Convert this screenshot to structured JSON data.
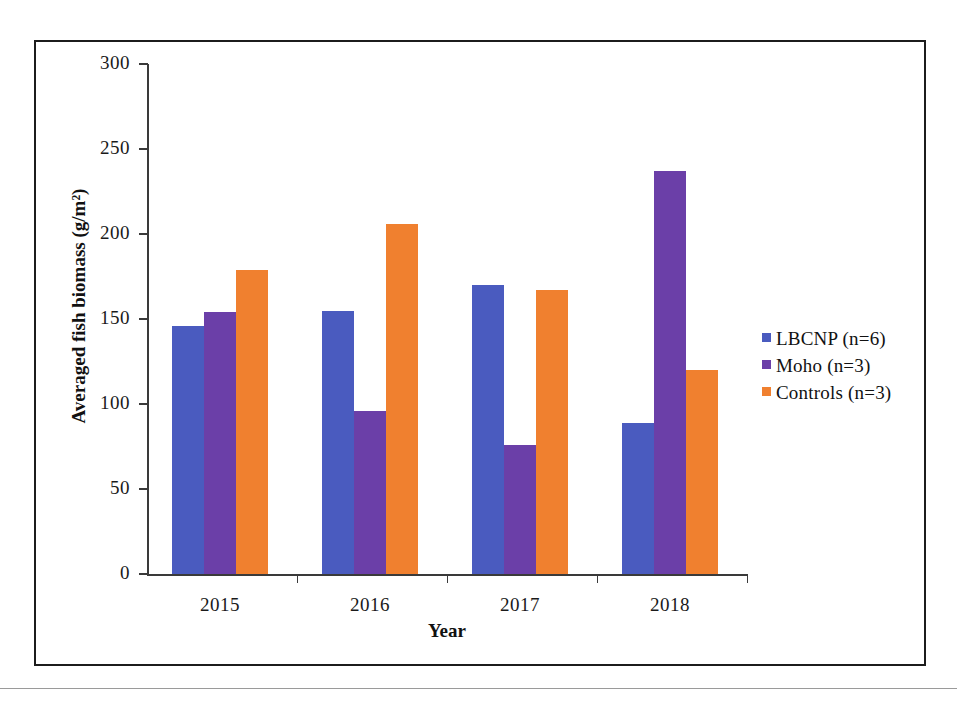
{
  "chart_data": {
    "type": "bar",
    "title": "",
    "xlabel": "Year",
    "ylabel": "Averaged fish biomass (g/m²)",
    "categories": [
      "2015",
      "2016",
      "2017",
      "2018"
    ],
    "series": [
      {
        "name": "LBCNP (n=6)",
        "color": "#4a5bbf",
        "values": [
          146,
          155,
          170,
          89
        ]
      },
      {
        "name": "Moho (n=3)",
        "color": "#6b3fa8",
        "values": [
          154,
          96,
          76,
          237
        ]
      },
      {
        "name": "Controls (n=3)",
        "color": "#f0802f",
        "values": [
          179,
          206,
          167,
          120
        ]
      }
    ],
    "ylim": [
      0,
      300
    ],
    "yticks": [
      "0",
      "50",
      "100",
      "150",
      "200",
      "250",
      "300"
    ],
    "ytick_values": [
      0,
      50,
      100,
      150,
      200,
      250,
      300
    ],
    "grid": false,
    "legend_position": "right",
    "bar_style": "grouped"
  },
  "axes": {
    "y_title": "Averaged fish biomass (g/m²)",
    "x_title": "Year"
  },
  "legend": {
    "items": [
      {
        "label": "LBCNP (n=6)",
        "color": "#4a5bbf"
      },
      {
        "label": "Moho (n=3)",
        "color": "#6b3fa8"
      },
      {
        "label": "Controls (n=3)",
        "color": "#f0802f"
      }
    ]
  }
}
